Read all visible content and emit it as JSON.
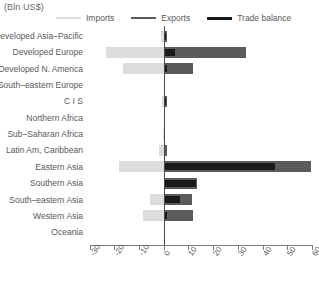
{
  "units_label": "(Bln US$)",
  "legend": {
    "items": [
      {
        "key": "imports",
        "label": "Imports",
        "color": "#dcdcdc"
      },
      {
        "key": "exports",
        "label": "Exports",
        "color": "#5b5b5b"
      },
      {
        "key": "balance",
        "label": "Trade balance",
        "color": "#1a1a1a"
      }
    ]
  },
  "chart_data": {
    "type": "bar",
    "orientation": "horizontal",
    "title": "",
    "subtitle": "",
    "xlabel": "(Bln US$)",
    "ylabel": "",
    "xlim": [
      -30,
      60
    ],
    "xticks": [
      -30,
      -20,
      -10,
      0,
      10,
      20,
      30,
      40,
      50,
      60
    ],
    "xtick_labels": [
      "-30",
      "-20",
      "-10",
      "0",
      "10",
      "20",
      "30",
      "40",
      "50",
      "60"
    ],
    "grid": false,
    "legend_position": "top",
    "categories": [
      "Developed Asia–Pacific",
      "Developed Europe",
      "Developed N. America",
      "South–eastern Europe",
      "C I S",
      "Northern Africa",
      "Sub–Saharan Africa",
      "Latin Am, Caribbean",
      "Eastern Asia",
      "Southern Asia",
      "South–eastern Asia",
      "Western Asia",
      "Oceania"
    ],
    "series": [
      {
        "name": "Imports",
        "color": "#dcdcdc",
        "values": [
          -1.0,
          -23.5,
          -16.5,
          -0.2,
          -0.6,
          -0.2,
          -0.3,
          -1.8,
          -18.0,
          0.0,
          -5.5,
          -8.5,
          0.0
        ]
      },
      {
        "name": "Exports",
        "color": "#5b5b5b",
        "values": [
          1.5,
          33.5,
          12.0,
          0.5,
          1.2,
          0.3,
          0.4,
          1.2,
          59.5,
          13.5,
          11.5,
          12.0,
          0.0
        ]
      },
      {
        "name": "Trade balance",
        "color": "#1a1a1a",
        "values": [
          1.0,
          4.5,
          1.5,
          0.4,
          0.8,
          0.2,
          0.3,
          0.6,
          45.0,
          13.0,
          6.5,
          1.5,
          0.0
        ]
      }
    ]
  }
}
